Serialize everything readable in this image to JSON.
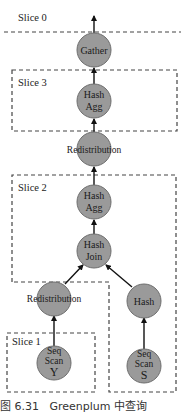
{
  "diagram": {
    "slices": [
      {
        "id": "slice0",
        "label": "Slice 0"
      },
      {
        "id": "slice3",
        "label": "Slice 3"
      },
      {
        "id": "slice2",
        "label": "Slice 2"
      },
      {
        "id": "slice1",
        "label": "Slice 1"
      }
    ],
    "nodes": {
      "gather": {
        "lines": [
          "Gather"
        ]
      },
      "hash_agg_top": {
        "lines": [
          "Hash",
          "Agg"
        ]
      },
      "redistribution_top": {
        "lines": [
          "Redistribution"
        ]
      },
      "hash_agg_mid": {
        "lines": [
          "Hash",
          "Agg"
        ]
      },
      "hash_join": {
        "lines": [
          "Hash",
          "Join"
        ]
      },
      "redistribution_bottom": {
        "lines": [
          "Redistribution"
        ]
      },
      "hash": {
        "lines": [
          "Hash"
        ]
      },
      "seq_scan_y": {
        "lines": [
          "Seq",
          "Scan",
          "Y"
        ]
      },
      "seq_scan_s": {
        "lines": [
          "Seq",
          "Scan",
          "S"
        ]
      }
    },
    "edges": [
      [
        "seq_scan_y",
        "redistribution_bottom"
      ],
      [
        "seq_scan_s",
        "hash"
      ],
      [
        "redistribution_bottom",
        "hash_join"
      ],
      [
        "hash",
        "hash_join"
      ],
      [
        "hash_join",
        "hash_agg_mid"
      ],
      [
        "hash_agg_mid",
        "redistribution_top"
      ],
      [
        "redistribution_top",
        "hash_agg_top"
      ],
      [
        "hash_agg_top",
        "gather"
      ],
      [
        "gather",
        "output"
      ]
    ],
    "colors": {
      "node_fill": "#9a9a9a",
      "edge": "#111111",
      "dash": "#444444"
    }
  },
  "caption": {
    "figure_number": "图 6.31",
    "text": "Greenplum 中查询"
  }
}
